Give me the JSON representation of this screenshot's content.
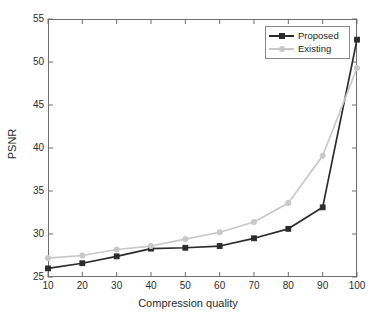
{
  "chart_data": {
    "type": "line",
    "title": "",
    "xlabel": "Compression quality",
    "ylabel": "PSNR",
    "x": [
      10,
      20,
      30,
      40,
      50,
      60,
      70,
      80,
      90,
      100
    ],
    "xlim": [
      10,
      100
    ],
    "ylim": [
      25,
      55
    ],
    "xticks": [
      10,
      20,
      30,
      40,
      50,
      60,
      70,
      80,
      90,
      100
    ],
    "yticks": [
      25,
      30,
      35,
      40,
      45,
      50,
      55
    ],
    "grid": false,
    "legend_position": "top-right",
    "series": [
      {
        "name": "Proposed",
        "color": "#2b2b2b",
        "marker": "square",
        "values": [
          26.0,
          26.6,
          27.4,
          28.3,
          28.4,
          28.6,
          29.5,
          30.6,
          33.1,
          52.6
        ]
      },
      {
        "name": "Existing",
        "color": "#c8c8c8",
        "marker": "circle",
        "values": [
          27.2,
          27.5,
          28.2,
          28.6,
          29.4,
          30.2,
          31.4,
          33.6,
          39.1,
          49.3
        ]
      }
    ]
  },
  "axes": {
    "xtick_labels": [
      "10",
      "20",
      "30",
      "40",
      "50",
      "60",
      "70",
      "80",
      "90",
      "100"
    ],
    "ytick_labels": [
      "25",
      "30",
      "35",
      "40",
      "45",
      "50",
      "55"
    ],
    "xtitle": "Compression quality",
    "ytitle": "PSNR"
  },
  "legend": {
    "entries": [
      {
        "label": "Proposed",
        "color": "#2b2b2b"
      },
      {
        "label": "Existing",
        "color": "#c8c8c8"
      }
    ]
  },
  "colors": {
    "proposed": "#2b2b2b",
    "existing": "#c8c8c8",
    "axis": "#6f6f6f",
    "text": "#2b2b2b",
    "background": "#ffffff"
  }
}
